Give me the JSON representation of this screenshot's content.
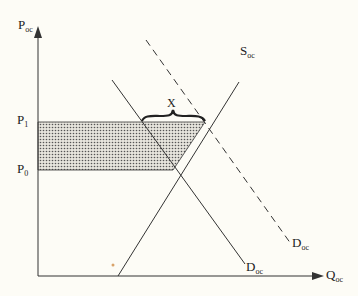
{
  "diagram": {
    "axes": {
      "y_label": "P",
      "y_sub": "oc",
      "x_label": "Q",
      "x_sub": "oc"
    },
    "price_levels": [
      {
        "label": "P",
        "sub": "1"
      },
      {
        "label": "P",
        "sub": "0"
      }
    ],
    "curves": {
      "supply": {
        "label": "S",
        "sub": "oc"
      },
      "demand": {
        "label": "D",
        "sub": "oc"
      },
      "demand_shifted": {
        "label": "D",
        "sub": "oc",
        "style": "dashed"
      }
    },
    "annotation": {
      "label": "X"
    },
    "colors": {
      "line": "#333333",
      "shade": "#b8b8b8",
      "background": "#fdfcf6"
    }
  }
}
